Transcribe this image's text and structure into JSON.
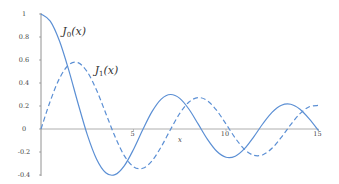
{
  "chart_data": {
    "type": "line",
    "title": "",
    "xlabel": "x",
    "ylabel": "",
    "xlim": [
      0,
      15
    ],
    "ylim": [
      -0.4,
      1
    ],
    "grid": false,
    "legend_position": "inline labels near curves",
    "x_ticks": [
      0,
      5,
      10,
      15
    ],
    "x_tick_labels": [
      "",
      "5",
      "10",
      "15"
    ],
    "y_ticks": [
      1,
      0.8,
      0.6,
      0.4,
      0.2,
      0,
      -0.2,
      -0.4
    ],
    "y_tick_labels": [
      "1",
      "0.8",
      "0.6",
      "0.4",
      "0.2",
      "0",
      "-0.2",
      "-0.4"
    ],
    "x": [
      0,
      0.5,
      1,
      1.5,
      2,
      2.5,
      3,
      3.5,
      4,
      4.5,
      5,
      5.5,
      6,
      6.5,
      7,
      7.5,
      8,
      8.5,
      9,
      9.5,
      10,
      10.5,
      11,
      11.5,
      12,
      12.5,
      13,
      13.5,
      14,
      14.5,
      15
    ],
    "series": [
      {
        "name": "J0(x)",
        "label_main": "J",
        "label_sub": "0",
        "label_arg": "(x)",
        "style": "solid",
        "color": "#5b8fd4",
        "values": [
          1,
          0.9385,
          0.7652,
          0.5118,
          0.2239,
          -0.0484,
          -0.2601,
          -0.3801,
          -0.3971,
          -0.3205,
          -0.1776,
          -0.0068,
          0.1506,
          0.2601,
          0.3001,
          0.2663,
          0.1717,
          0.0419,
          -0.0903,
          -0.1939,
          -0.2459,
          -0.2366,
          -0.1712,
          -0.0677,
          0.0477,
          0.1469,
          0.2069,
          0.215,
          0.1711,
          0.0875,
          -0.0142
        ]
      },
      {
        "name": "J1(x)",
        "label_main": "J",
        "label_sub": "1",
        "label_arg": "(x)",
        "style": "dashed",
        "color": "#5b8fd4",
        "values": [
          0,
          0.2423,
          0.4401,
          0.5579,
          0.5767,
          0.4971,
          0.3391,
          0.1374,
          -0.066,
          -0.2311,
          -0.3276,
          -0.3414,
          -0.2767,
          -0.1538,
          -0.0047,
          0.1352,
          0.2346,
          0.2731,
          0.2453,
          0.1613,
          0.0435,
          -0.0789,
          -0.1768,
          -0.2284,
          -0.2234,
          -0.1655,
          -0.0703,
          0.038,
          0.1334,
          0.1934,
          0.2051
        ]
      }
    ],
    "annotations": [
      {
        "text": "J0(x)",
        "x": 1.15,
        "y": 0.82
      },
      {
        "text": "J1(x)",
        "x": 2.9,
        "y": 0.48
      }
    ]
  }
}
